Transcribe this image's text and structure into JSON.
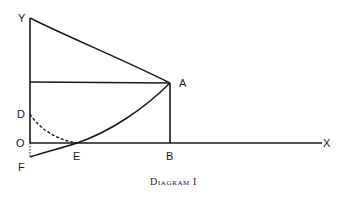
{
  "diagram": {
    "caption": "Diagram I",
    "labels": {
      "Y": "Y",
      "A": "A",
      "D": "D",
      "O": "O",
      "E": "E",
      "B": "B",
      "X": "X",
      "F": "F"
    },
    "points": {
      "Y": [
        30,
        18
      ],
      "A": [
        170,
        83
      ],
      "D": [
        30,
        114
      ],
      "O": [
        30,
        143
      ],
      "E": [
        77,
        143
      ],
      "B": [
        170,
        143
      ],
      "X": [
        322,
        143
      ],
      "F": [
        30,
        157
      ]
    },
    "elements": [
      "y-axis from O to Y",
      "x-axis from O to X",
      "curve from Y down to A",
      "horizontal line through A to y-axis",
      "vertical line A to B",
      "rising curve from F through E to A",
      "dashed curve from D to E",
      "dotted segment O to F"
    ]
  }
}
